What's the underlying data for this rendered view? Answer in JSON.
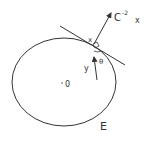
{
  "diagram": {
    "ellipse_label": "E",
    "center_label": "0",
    "point_label": "x",
    "normal_label": "C",
    "normal_exponent": "-2",
    "normal_var": "x",
    "vector_label": "y",
    "angle_label": "θ",
    "colors": {
      "stroke": "#333333",
      "background": "#ffffff"
    }
  }
}
